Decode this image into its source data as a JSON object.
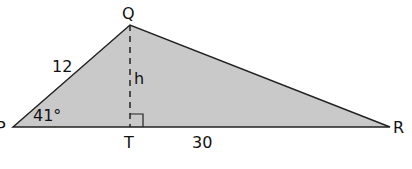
{
  "diagram": {
    "type": "triangle",
    "vertices": {
      "P": {
        "label": "P",
        "x": 13,
        "y": 127
      },
      "Q": {
        "label": "Q",
        "x": 130,
        "y": 25
      },
      "R": {
        "label": "R",
        "x": 390,
        "y": 127
      },
      "T": {
        "label": "T",
        "x": 130,
        "y": 127
      }
    },
    "labels": {
      "side_pq": "12",
      "side_tr": "30",
      "height": "h",
      "angle_p": "41°"
    },
    "colors": {
      "fill": "#c9c9c9",
      "stroke": "#222222"
    }
  }
}
